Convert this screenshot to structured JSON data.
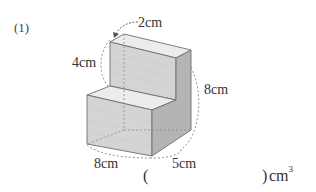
{
  "question": {
    "number": "(1)"
  },
  "figure": {
    "shape": "stepped-rectangular-solid",
    "dimensions": {
      "top_width": "2cm",
      "upper_step_height": "4cm",
      "total_height": "8cm",
      "length": "8cm",
      "depth": "5cm"
    },
    "colors": {
      "front_face": "#d4d4d4",
      "top_face": "#ececec",
      "side_face": "#b4b4b4",
      "edge": "#6e6e6e",
      "hidden_edge": "#8a8a8a"
    }
  },
  "answer": {
    "open_paren": "(",
    "close_paren": ")",
    "unit": "cm",
    "unit_exponent": "3",
    "value": ""
  }
}
